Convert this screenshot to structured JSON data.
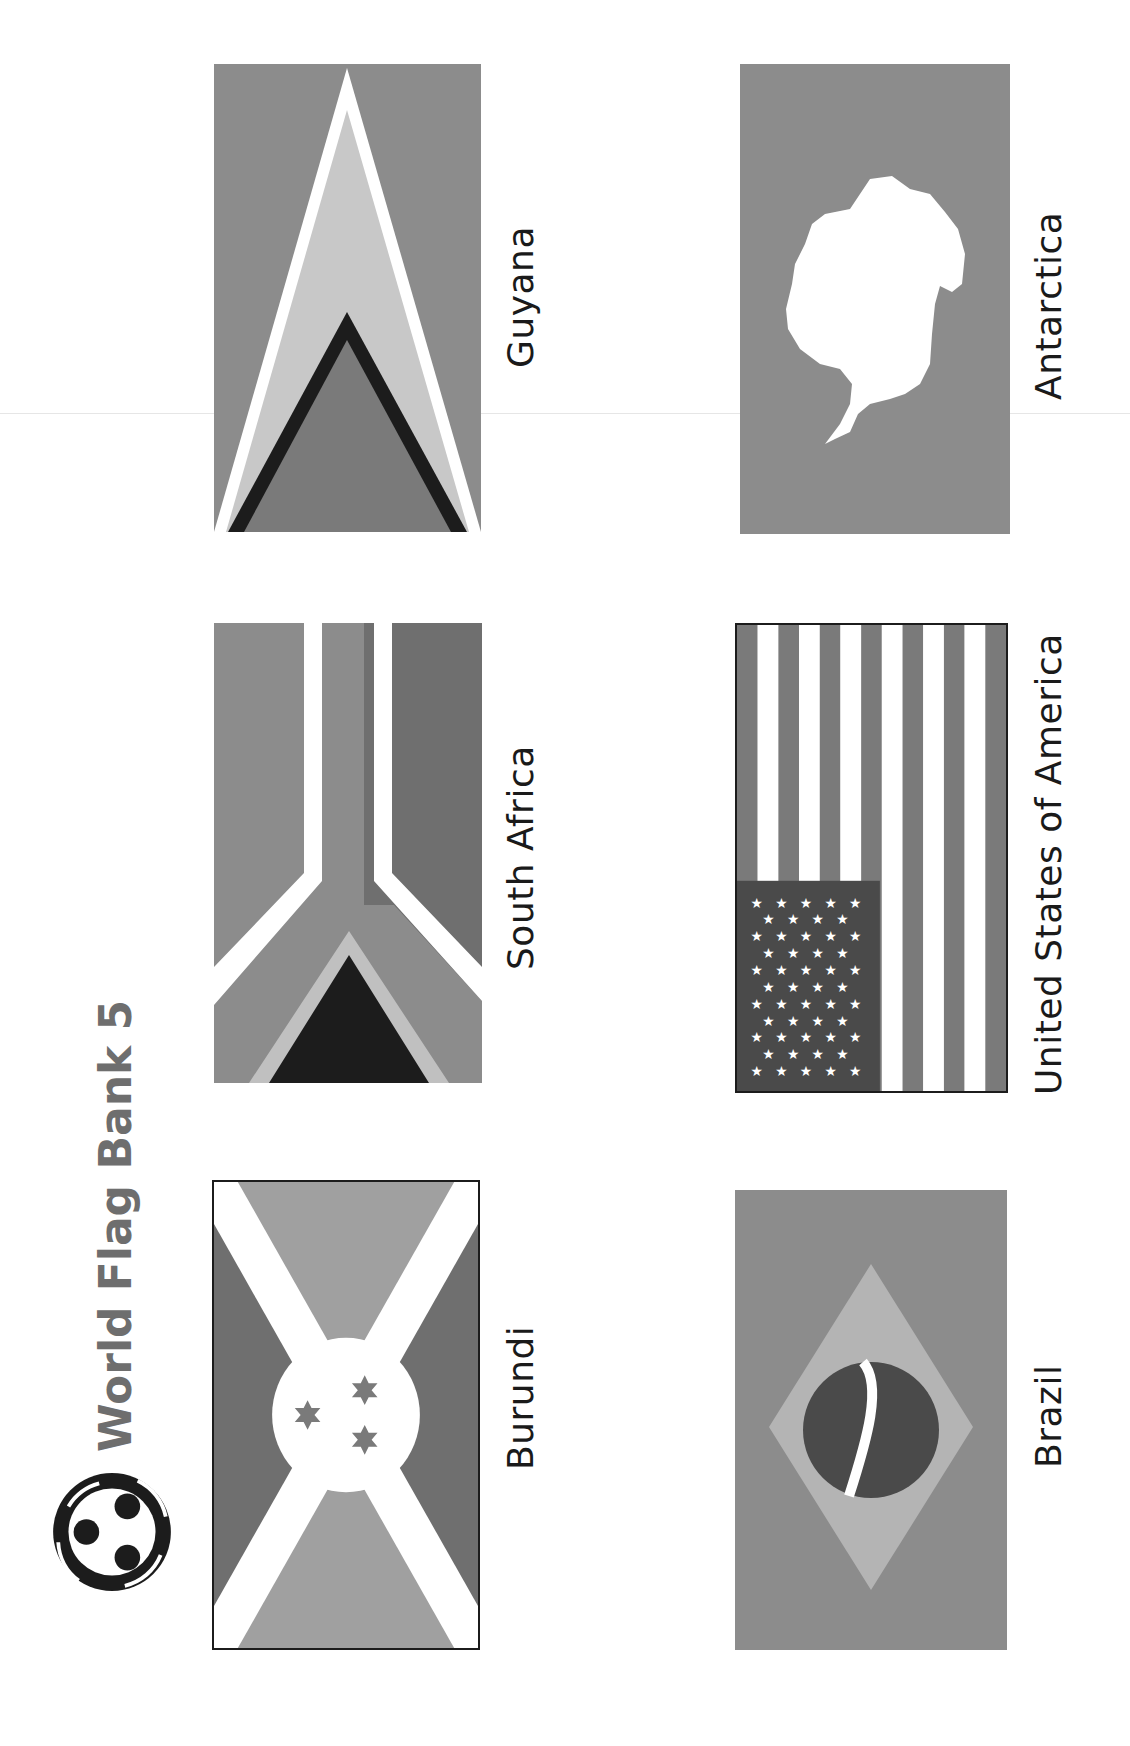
{
  "page": {
    "title": "World Flag Bank 5",
    "orientation": "rotated-90-ccw",
    "logo_icon": "people-circle-logo-icon"
  },
  "colors": {
    "light_gray": "#a9a9a9",
    "mid_gray": "#8c8c8c",
    "dark_gray": "#6f6f6f",
    "darker_gray": "#4a4a4a",
    "black": "#1c1c1c",
    "pale_gray": "#c8c8c8",
    "white": "#ffffff"
  },
  "flags": [
    {
      "id": "guyana",
      "label": "Guyana",
      "column": 1,
      "row": 1
    },
    {
      "id": "south-africa",
      "label": "South Africa",
      "column": 1,
      "row": 2
    },
    {
      "id": "burundi",
      "label": "Burundi",
      "column": 1,
      "row": 3
    },
    {
      "id": "antarctica",
      "label": "Antarctica",
      "column": 2,
      "row": 1
    },
    {
      "id": "usa",
      "label": "United States of America",
      "column": 2,
      "row": 2
    },
    {
      "id": "brazil",
      "label": "Brazil",
      "column": 2,
      "row": 3
    }
  ]
}
